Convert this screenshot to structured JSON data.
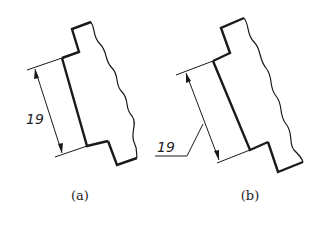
{
  "figures": [
    {
      "id": "a",
      "caption": "(a)",
      "dimension_value": "19",
      "dimension_style": "text placed alongside dimension line"
    },
    {
      "id": "b",
      "caption": "(b)",
      "dimension_value": "19",
      "dimension_style": "text placed on leader line"
    }
  ],
  "colors": {
    "line": "#1a1a1a",
    "background": "#ffffff"
  }
}
